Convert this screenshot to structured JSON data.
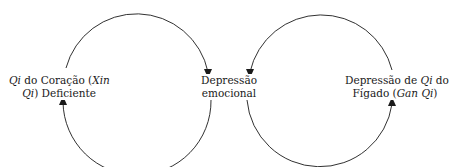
{
  "diagram": {
    "nodes": [
      {
        "id": "heart-qi",
        "line1_pre": "",
        "line1_it": "Qi",
        "line1_post": " do Coração (",
        "line1_it2": "Xin",
        "line2_it": "Qi",
        "line2_post": ") Deficiente"
      },
      {
        "id": "emotional-depression",
        "line1": "Depressão",
        "line2": "emocional"
      },
      {
        "id": "liver-qi",
        "line1_pre": "Depressão de ",
        "line1_it": "Qi",
        "line1_post": " do",
        "line2_pre": "Fígado (",
        "line2_it": "Gan Qi",
        "line2_post": ")"
      }
    ],
    "edges": [
      {
        "from": "heart-qi",
        "to": "emotional-depression",
        "path": "upper-left-arc"
      },
      {
        "from": "emotional-depression",
        "to": "heart-qi",
        "path": "lower-left-arc"
      },
      {
        "from": "liver-qi",
        "to": "emotional-depression",
        "path": "upper-right-arc"
      },
      {
        "from": "emotional-depression",
        "to": "liver-qi",
        "path": "lower-right-arc"
      }
    ],
    "colors": {
      "line": "#1a1a1a",
      "background": "#ffffff"
    }
  }
}
